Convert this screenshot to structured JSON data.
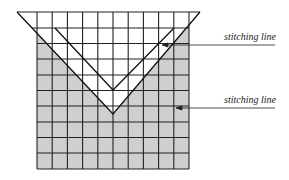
{
  "diagram": {
    "grid": {
      "columns": 10,
      "rows": 10,
      "fill": "#cfcfcf",
      "line": "#222222"
    },
    "labels": [
      {
        "text": "stitching line"
      },
      {
        "text": "stitching line"
      }
    ]
  }
}
